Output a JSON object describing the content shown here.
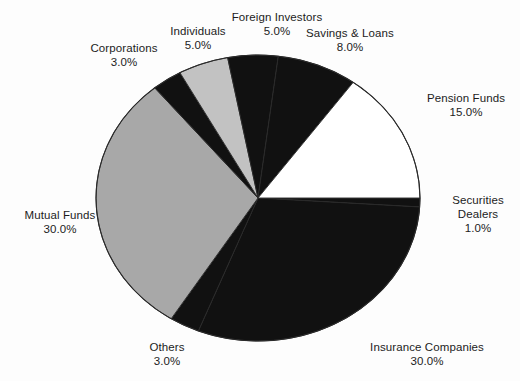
{
  "chart_data": {
    "type": "pie",
    "title": "",
    "subtitle": "",
    "xlabel": "",
    "ylabel": "",
    "legend_position": "none",
    "grid": false,
    "labels_format": "name + percent, placed outside slices",
    "start_angle_deg": 0,
    "direction": "clockwise",
    "categories": [
      "Securities Dealers",
      "Insurance Companies",
      "Others",
      "Mutual Funds",
      "Corporations",
      "Individuals",
      "Foreign Investors",
      "Savings & Loans",
      "Pension Funds"
    ],
    "values": [
      1.0,
      30.0,
      3.0,
      30.0,
      3.0,
      5.0,
      5.0,
      8.0,
      15.0
    ],
    "total": 100.0,
    "slices": [
      {
        "name": "Securities Dealers",
        "value": 1.0,
        "value_label": "1.0%",
        "color": "#111111",
        "start_deg": 0.0,
        "sweep_deg": 3.6,
        "label_name": "Securities",
        "label_name2": "Dealers"
      },
      {
        "name": "Insurance Companies",
        "value": 30.0,
        "value_label": "30.0%",
        "color": "#111111",
        "start_deg": 3.6,
        "sweep_deg": 108.0,
        "label_name": "Insurance Companies"
      },
      {
        "name": "Others",
        "value": 3.0,
        "value_label": "3.0%",
        "color": "#111111",
        "start_deg": 111.6,
        "sweep_deg": 10.8,
        "label_name": "Others"
      },
      {
        "name": "Mutual Funds",
        "value": 30.0,
        "value_label": "30.0%",
        "color": "#a8a8a8",
        "start_deg": 122.4,
        "sweep_deg": 108.0,
        "label_name": "Mutual Funds"
      },
      {
        "name": "Corporations",
        "value": 3.0,
        "value_label": "3.0%",
        "color": "#111111",
        "start_deg": 230.4,
        "sweep_deg": 10.8,
        "label_name": "Corporations"
      },
      {
        "name": "Individuals",
        "value": 5.0,
        "value_label": "5.0%",
        "color": "#c2c2c2",
        "start_deg": 241.2,
        "sweep_deg": 18.0,
        "label_name": "Individuals"
      },
      {
        "name": "Foreign Investors",
        "value": 5.0,
        "value_label": "5.0%",
        "color": "#111111",
        "start_deg": 259.2,
        "sweep_deg": 18.0,
        "label_name": "Foreign Investors"
      },
      {
        "name": "Savings & Loans",
        "value": 8.0,
        "value_label": "8.0%",
        "color": "#111111",
        "start_deg": 277.2,
        "sweep_deg": 28.8,
        "label_name": "Savings & Loans"
      },
      {
        "name": "Pension Funds",
        "value": 15.0,
        "value_label": "15.0%",
        "color": "#ffffff",
        "start_deg": 306.0,
        "sweep_deg": 54.0,
        "label_name": "Pension Funds"
      }
    ],
    "colors": {
      "black": "#111111",
      "gray": "#a8a8a8",
      "light_gray": "#c2c2c2",
      "white": "#ffffff",
      "outline": "#2a2a2a",
      "background": "#fdfdfd",
      "text": "#1c1c1c"
    },
    "geometry": {
      "center_x": 258,
      "center_y": 198,
      "radius_x": 162,
      "radius_y": 143
    }
  }
}
